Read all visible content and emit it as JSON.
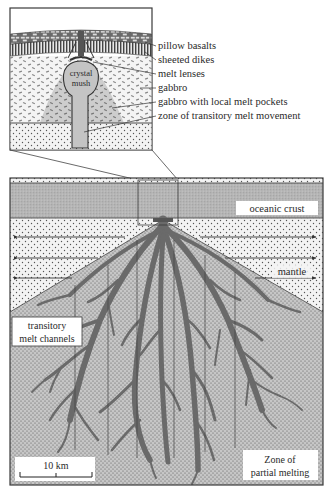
{
  "inset": {
    "labels": [
      {
        "id": "pillow-basalts",
        "text": "pillow basalts"
      },
      {
        "id": "sheeted-dikes",
        "text": "sheeted dikes"
      },
      {
        "id": "melt-lenses",
        "text": "melt lenses"
      },
      {
        "id": "gabbro",
        "text": "gabbro"
      },
      {
        "id": "gabbro-melt-pockets",
        "text": "gabbro with local melt pockets"
      },
      {
        "id": "transitory-melt-zone",
        "text": "zone of transitory melt movement"
      }
    ],
    "crystal_mush": {
      "line1": "crystal",
      "line2": "mush"
    }
  },
  "main": {
    "oceanic_crust_label": "oceanic crust",
    "mantle_label": "mantle",
    "channels_label": {
      "line1": "transitory",
      "line2": "melt channels"
    },
    "partial_melting_label": {
      "line1": "Zone of",
      "line2": "partial melting"
    },
    "scale_bar_label": "10 km"
  },
  "colors": {
    "outline": "#3a3a3a",
    "crust_fill": "#b8b8b8",
    "mantle_fill": "#f2f2f2",
    "melting_fill": "#c9c9c9",
    "channel_fill": "#6e6e6e",
    "gabbro_melt_fill": "#cfcfcf"
  }
}
